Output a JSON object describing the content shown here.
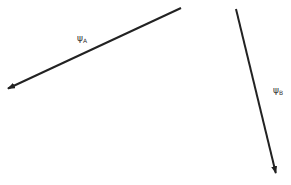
{
  "diagram": {
    "vectors": [
      {
        "id": "A",
        "label": "ψ",
        "subscript": "A",
        "start": [
          181,
          8
        ],
        "end": [
          7,
          89
        ],
        "color": "#222222"
      },
      {
        "id": "B",
        "label": "ψ",
        "subscript": "B",
        "start": [
          236,
          9
        ],
        "end": [
          276,
          174
        ],
        "color": "#222222"
      }
    ]
  }
}
